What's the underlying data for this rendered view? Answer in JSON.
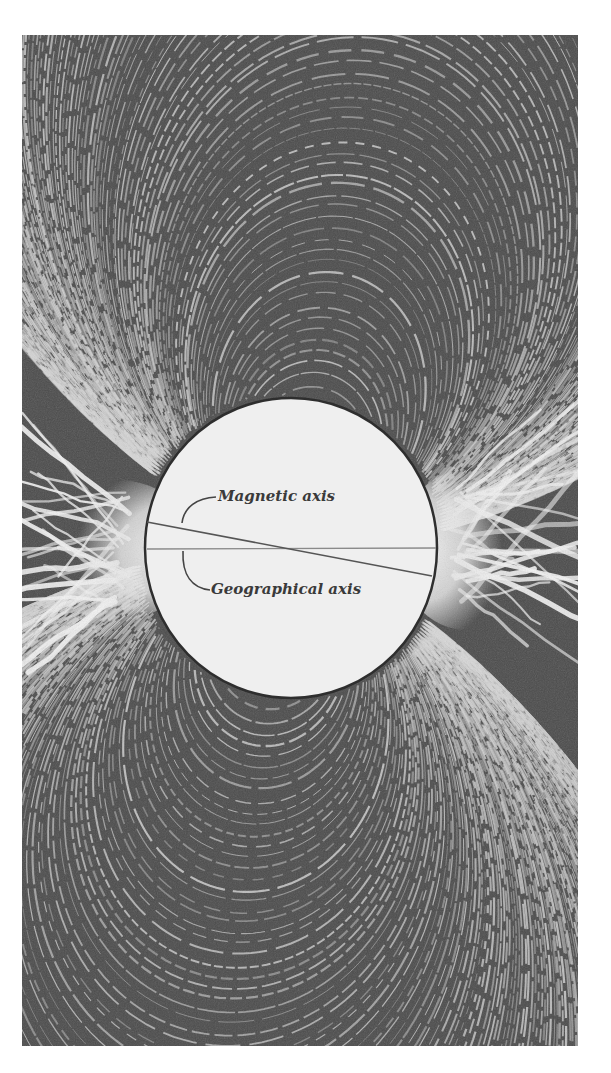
{
  "figure": {
    "frame": {
      "x": 22,
      "y": 35,
      "width": 556,
      "height": 1011
    },
    "background_color": "#4a4a4a",
    "field_line_color": "#d8d8d8",
    "bright_streak_color": "#f2f2f2",
    "globe": {
      "cx": 269,
      "cy": 513,
      "rx": 146,
      "ry": 150,
      "fill": "#efefef",
      "stroke": "#2e2e2e"
    },
    "glow": {
      "fill": "#f4f4f4"
    },
    "magnetic_axis": {
      "x1": 125,
      "y1": 487,
      "x2": 410,
      "y2": 541
    },
    "geographical_axis": {
      "x1": 125,
      "y1": 514,
      "x2": 414,
      "y2": 513
    },
    "labels": {
      "magnetic_axis": "Magnetic axis",
      "geographical_axis": "Geographical axis"
    }
  }
}
